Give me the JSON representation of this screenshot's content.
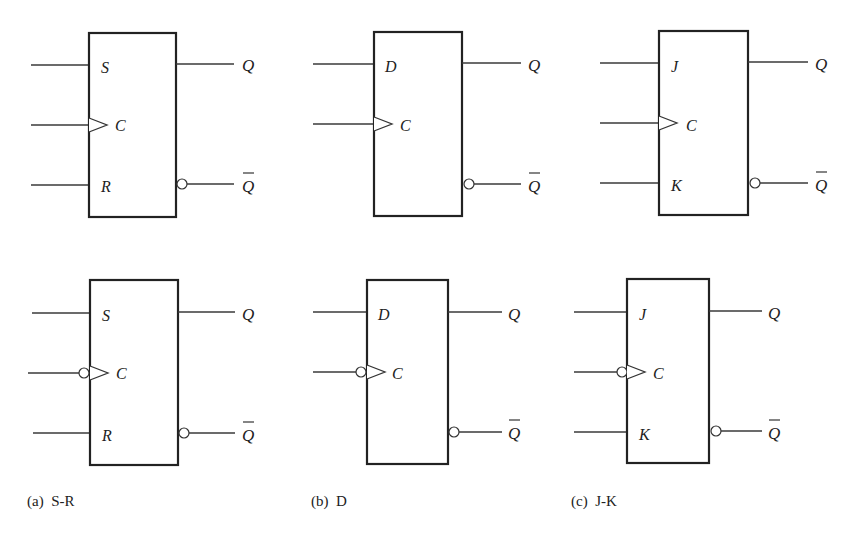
{
  "figure": {
    "columns": [
      {
        "id": "sr",
        "caption": "(a)  S-R",
        "inputs": [
          "S",
          "C",
          "R"
        ],
        "outputs": [
          "Q",
          "Q"
        ],
        "output_complement": [
          false,
          true
        ]
      },
      {
        "id": "d",
        "caption": "(b)  D",
        "inputs": [
          "D",
          "C"
        ],
        "outputs": [
          "Q",
          "Q"
        ],
        "output_complement": [
          false,
          true
        ]
      },
      {
        "id": "jk",
        "caption": "(c)  J-K",
        "inputs": [
          "J",
          "C",
          "K"
        ],
        "outputs": [
          "Q",
          "Q"
        ],
        "output_complement": [
          false,
          true
        ]
      }
    ],
    "rows": [
      {
        "id": "positive-edge",
        "clock_inverted": false
      },
      {
        "id": "negative-edge",
        "clock_inverted": true
      }
    ]
  },
  "colors": {
    "line": "#3a3a3a",
    "box": "#222222",
    "background": "#ffffff"
  }
}
